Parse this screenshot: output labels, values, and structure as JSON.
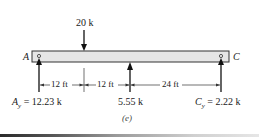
{
  "diagram": {
    "caption": "(e)",
    "beam": {
      "left_label": "A",
      "right_label": "C",
      "fill": "#e6e6e6",
      "stroke": "#333333"
    },
    "applied_load": {
      "label": "20 k",
      "direction": "down"
    },
    "reactions": [
      {
        "name": "A_y",
        "symbol": "A",
        "subscript": "y",
        "eq": " = 12.23 k"
      },
      {
        "name": "B",
        "label": "5.55 k"
      },
      {
        "name": "C_y",
        "symbol": "C",
        "subscript": "y",
        "eq": " = 2.22 k"
      }
    ],
    "dimensions": [
      {
        "label": "12 ft"
      },
      {
        "label": "12 ft"
      },
      {
        "label": "24 ft"
      }
    ]
  }
}
